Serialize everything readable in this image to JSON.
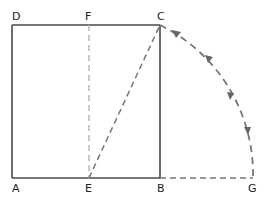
{
  "colors": {
    "line": "#4a4a4a",
    "dashed": "#777777",
    "background": "#ffffff"
  },
  "points": {
    "A": {
      "label": "A",
      "x": 12,
      "y": 178
    },
    "B": {
      "label": "B",
      "x": 160,
      "y": 178
    },
    "C": {
      "label": "C",
      "x": 160,
      "y": 25
    },
    "D": {
      "label": "D",
      "x": 12,
      "y": 25
    },
    "E": {
      "label": "E",
      "x": 89,
      "y": 178
    },
    "F": {
      "label": "F",
      "x": 89,
      "y": 25
    },
    "G": {
      "label": "G",
      "x": 253,
      "y": 178
    }
  },
  "labels": [
    {
      "id": "D",
      "text": "D"
    },
    {
      "id": "F",
      "text": "F"
    },
    {
      "id": "C",
      "text": "C"
    },
    {
      "id": "A",
      "text": "A"
    },
    {
      "id": "E",
      "text": "E"
    },
    {
      "id": "B",
      "text": "B"
    },
    {
      "id": "G",
      "text": "G"
    }
  ],
  "segments": {
    "solid": [
      "AD",
      "DC",
      "CB",
      "AB"
    ],
    "dashed": [
      "EF",
      "EC",
      "BG"
    ],
    "arc": {
      "from": "C",
      "to": "G",
      "center": "E",
      "arrows": 4
    }
  }
}
